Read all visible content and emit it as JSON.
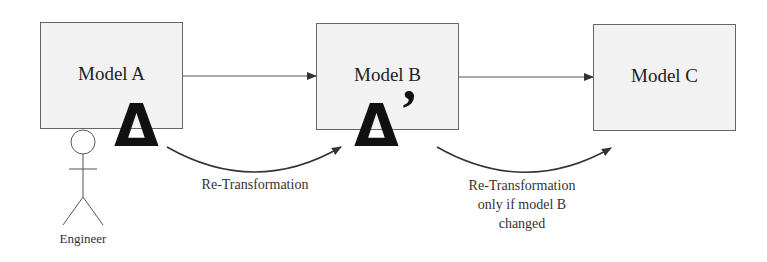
{
  "models": [
    {
      "id": "a",
      "label": "Model A"
    },
    {
      "id": "b",
      "label": "Model B"
    },
    {
      "id": "c",
      "label": "Model C"
    }
  ],
  "deltas": {
    "delta_a": "Δ",
    "delta_b": "Δ",
    "delta_b_prime": "’"
  },
  "edges": {
    "re_transform_1": "Re-Transformation",
    "re_transform_2_line1": "Re-Transformation",
    "re_transform_2_line2": "only if model B",
    "re_transform_2_line3": "changed"
  },
  "actor": {
    "label": "Engineer"
  },
  "colors": {
    "box_fill": "#f2f2f2",
    "box_border": "#666666",
    "line": "#333333"
  }
}
